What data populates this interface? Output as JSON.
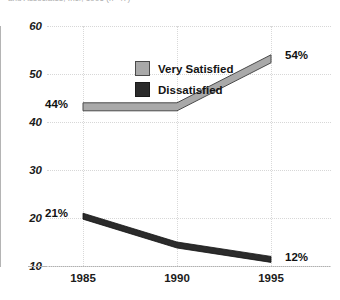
{
  "clipped_caption": "and Associates, Inc., 1996 (n=47)",
  "chart_data": {
    "type": "line",
    "title": "",
    "subtitle": "",
    "xlabel": "",
    "ylabel": "",
    "categories": [
      "1985",
      "1990",
      "1995"
    ],
    "x": [
      1985,
      1990,
      1995
    ],
    "xtick_labels": [
      "1985",
      "1990",
      "1995"
    ],
    "ytick_labels": [
      "10",
      "20",
      "30",
      "40",
      "50",
      "60"
    ],
    "yticks": [
      10,
      20,
      30,
      40,
      50,
      60
    ],
    "ylim": [
      10,
      60
    ],
    "grid": "both-dotted",
    "legend_position": "top-left-inside",
    "series": [
      {
        "name": "Very Satisfied",
        "color": "#a9a9a9",
        "edge_color": "#4a4a4a",
        "values": [
          44,
          44,
          54
        ],
        "point_labels": [
          "44%",
          "",
          "54%"
        ]
      },
      {
        "name": "Dissatisfied",
        "color": "#2b2b2b",
        "edge_color": "#111111",
        "values": [
          21,
          15,
          12
        ],
        "point_labels": [
          "21%",
          "",
          "12%"
        ]
      }
    ],
    "annotations": [
      {
        "text": "44%",
        "series": "Very Satisfied",
        "x": "1985",
        "value": 44
      },
      {
        "text": "54%",
        "series": "Very Satisfied",
        "x": "1995",
        "value": 54
      },
      {
        "text": "21%",
        "series": "Dissatisfied",
        "x": "1985",
        "value": 21
      },
      {
        "text": "12%",
        "series": "Dissatisfied",
        "x": "1995",
        "value": 12
      }
    ]
  },
  "legend": {
    "items": [
      {
        "label": "Very Satisfied",
        "color": "#a9a9a9"
      },
      {
        "label": "Dissatisfied",
        "color": "#2b2b2b"
      }
    ]
  },
  "axes": {
    "y_labels": [
      "60",
      "50",
      "40",
      "30",
      "20",
      "10"
    ],
    "x_labels": [
      "1985",
      "1990",
      "1995"
    ]
  },
  "data_labels": {
    "very_satisfied_start": "44%",
    "very_satisfied_end": "54%",
    "dissatisfied_start": "21%",
    "dissatisfied_end": "12%"
  },
  "colors": {
    "very_satisfied": "#a9a9a9",
    "dissatisfied": "#2b2b2b",
    "grid": "#d7d7d7",
    "axis": "#b0b0b0",
    "text": "#141414",
    "background": "#ffffff"
  }
}
